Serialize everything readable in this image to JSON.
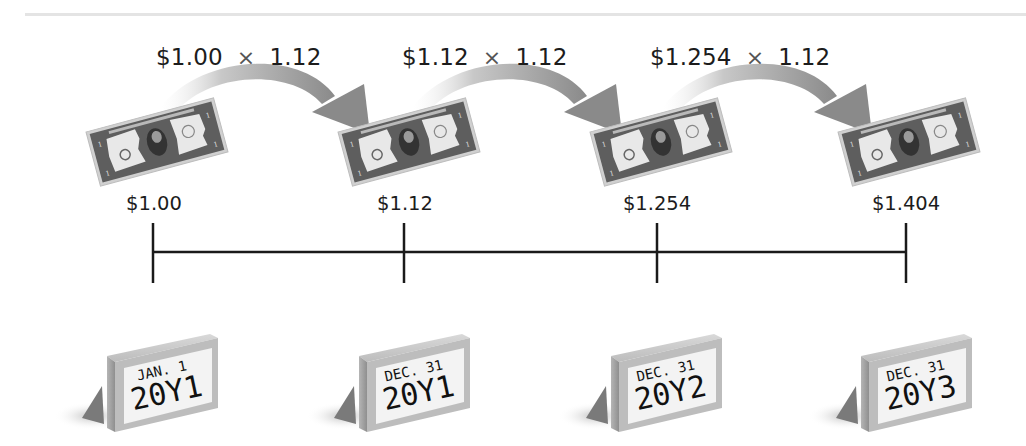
{
  "diagram": {
    "growth_steps": [
      {
        "base": "$1.00",
        "operator": "×",
        "factor": "1.12"
      },
      {
        "base": "$1.12",
        "operator": "×",
        "factor": "1.12"
      },
      {
        "base": "$1.254",
        "operator": "×",
        "factor": "1.12"
      }
    ],
    "points": [
      {
        "amount": "$1.00",
        "date_line1": "JAN. 1",
        "date_line2": "20Y1",
        "icon": "dollar-bill-icon",
        "calendar_icon": "calendar-icon"
      },
      {
        "amount": "$1.12",
        "date_line1": "DEC. 31",
        "date_line2": "20Y1",
        "icon": "dollar-bill-icon",
        "calendar_icon": "calendar-icon"
      },
      {
        "amount": "$1.254",
        "date_line1": "DEC. 31",
        "date_line2": "20Y2",
        "icon": "dollar-bill-icon",
        "calendar_icon": "calendar-icon"
      },
      {
        "amount": "$1.404",
        "date_line1": "DEC. 31",
        "date_line2": "20Y3",
        "icon": "dollar-bill-icon",
        "calendar_icon": "calendar-icon"
      }
    ],
    "colors": {
      "arrow": "#8c8c8c",
      "bill_border": "#5a5a5a",
      "bill_panel": "#e9e9e9",
      "timeline": "#1a1a1a",
      "calendar_face": "#f2f2f2",
      "calendar_edge": "#a8a8a8"
    }
  }
}
